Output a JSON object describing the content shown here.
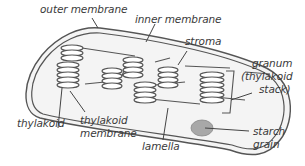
{
  "diagram": {
    "colors": {
      "outline": "#555555",
      "fill": "#f4f4f4",
      "starch": "#a8a8a8",
      "text": "#3a3a3a"
    },
    "labels": {
      "outer_membrane": "outer membrane",
      "inner_membrane": "inner membrane",
      "stroma": "stroma",
      "granum_line1": "granum",
      "granum_line2": "(thylakoid",
      "granum_line3": "stack)",
      "thylakoid": "thylakoid",
      "thylakoid_membrane_line1": "thylakoid",
      "thylakoid_membrane_line2": "membrane",
      "lamella": "lamella",
      "starch_grain_line1": "starch",
      "starch_grain_line2": "grain"
    }
  }
}
